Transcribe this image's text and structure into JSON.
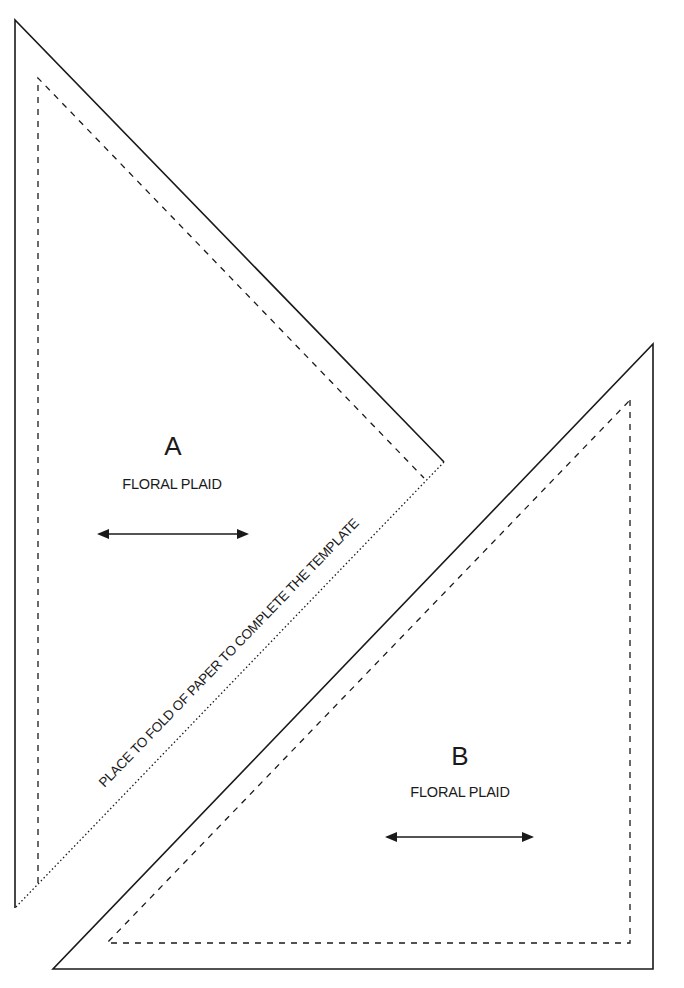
{
  "template": {
    "colors": {
      "line": "#1a1a1a",
      "background": "#ffffff"
    },
    "pieces": [
      {
        "id": "A",
        "letter": "A",
        "fabric": "FLORAL PLAID",
        "grainline": "double-headed-arrow"
      },
      {
        "id": "B",
        "letter": "B",
        "fabric": "FLORAL PLAID",
        "grainline": "double-headed-arrow"
      }
    ],
    "fold_instruction": "PLACE TO FOLD OF PAPER TO COMPLETE THE TEMPLATE",
    "legend": {
      "solid_line": "cutting-line",
      "dashed_line": "seam-line",
      "dotted_line": "fold-line"
    }
  }
}
